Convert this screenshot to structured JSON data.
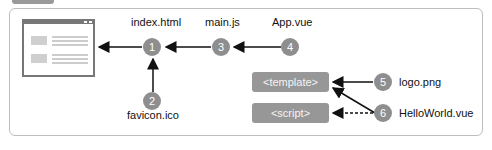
{
  "diagram": {
    "nodes": [
      {
        "id": 1,
        "label": "index.html"
      },
      {
        "id": 2,
        "label": "favicon.ico"
      },
      {
        "id": 3,
        "label": "main.js"
      },
      {
        "id": 4,
        "label": "App.vue"
      },
      {
        "id": 5,
        "label": "logo.png"
      },
      {
        "id": 6,
        "label": "HelloWorld.vue"
      }
    ],
    "numbers": [
      "1",
      "2",
      "3",
      "4",
      "5",
      "6"
    ],
    "blocks": {
      "template": "<template>",
      "script": "<script>"
    },
    "browser_icon": "browser-window-icon",
    "edges": [
      {
        "from": 1,
        "to": "browser",
        "style": "solid"
      },
      {
        "from": 2,
        "to": 1,
        "style": "solid"
      },
      {
        "from": 3,
        "to": 1,
        "style": "solid"
      },
      {
        "from": 4,
        "to": 3,
        "style": "solid"
      },
      {
        "from": 5,
        "to": "template",
        "style": "solid"
      },
      {
        "from": 6,
        "to": "template",
        "style": "solid"
      },
      {
        "from": 6,
        "to": "script",
        "style": "dashed"
      }
    ]
  }
}
